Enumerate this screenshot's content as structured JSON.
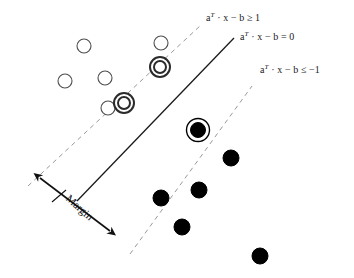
{
  "figure": {
    "background_color": "#ffffff",
    "width": 354,
    "height": 278
  },
  "labels": {
    "upper_boundary": {
      "text": "aT · x − b ≥ 1",
      "a": "a",
      "sup": "T",
      "rest": " · x − b ≥ 1",
      "x": 206,
      "y": 11,
      "color": "#1a1a1a"
    },
    "hyperplane": {
      "text": "aT · x − b = 0",
      "a": "a",
      "sup": "T",
      "rest": " · x − b = 0",
      "x": 240,
      "y": 30,
      "color": "#1a1a1a"
    },
    "lower_boundary": {
      "text": "aT · x − b ≤ −1",
      "a": "a",
      "sup": "T",
      "rest": " · x − b ≤ −1",
      "x": 260,
      "y": 63,
      "color": "#1a1a1a"
    },
    "margin": {
      "text": "Margin",
      "x": 72,
      "y": 192,
      "rotation_deg": 42,
      "color": "#111111"
    }
  },
  "chart_data": {
    "type": "scatter",
    "xlabel": "",
    "ylabel": "",
    "grid": false,
    "legend": "none",
    "xlim": [
      0,
      354
    ],
    "ylim": [
      0,
      278
    ],
    "note": "Coordinates are in image pixel space; y increases downward.",
    "lines": [
      {
        "name": "upper-margin-boundary",
        "equation": "aT · x − b = 1",
        "style": "dashed",
        "color": "#999999",
        "width": 1,
        "x1": 28,
        "y1": 186,
        "x2": 201,
        "y2": 25
      },
      {
        "name": "separating-hyperplane",
        "equation": "aT · x − b = 0",
        "style": "solid",
        "color": "#1a1a1a",
        "width": 1.3,
        "x1": 77,
        "y1": 201,
        "x2": 234,
        "y2": 38
      },
      {
        "name": "lower-margin-boundary",
        "equation": "aT · x − b = −1",
        "style": "dashed",
        "color": "#999999",
        "width": 1,
        "x1": 130,
        "y1": 254,
        "x2": 252,
        "y2": 86
      }
    ],
    "margin_arrow": {
      "name": "margin-double-arrow",
      "color": "#111111",
      "width": 1.6,
      "x1": 40,
      "y1": 178,
      "x2": 110,
      "y2": 231,
      "tick": {
        "x1": 52,
        "y1": 202,
        "x2": 66,
        "y2": 190
      },
      "double_headed": true
    },
    "series": [
      {
        "name": "class-positive",
        "marker": "hollow-circle",
        "marker_color": "#ffffff",
        "edge_color": "#4d4d4d",
        "radius": 7,
        "points": [
          {
            "x": 84,
            "y": 46,
            "support_vector": false
          },
          {
            "x": 161,
            "y": 43,
            "support_vector": false
          },
          {
            "x": 65,
            "y": 81,
            "support_vector": false
          },
          {
            "x": 105,
            "y": 78,
            "support_vector": false
          },
          {
            "x": 108,
            "y": 108,
            "support_vector": false
          },
          {
            "x": 160,
            "y": 67,
            "support_vector": true
          },
          {
            "x": 124,
            "y": 103,
            "support_vector": true
          }
        ]
      },
      {
        "name": "class-negative",
        "marker": "filled-circle",
        "marker_color": "#000000",
        "edge_color": "#000000",
        "radius": 8,
        "points": [
          {
            "x": 198,
            "y": 130,
            "support_vector": true
          },
          {
            "x": 231,
            "y": 158,
            "support_vector": false
          },
          {
            "x": 199,
            "y": 190,
            "support_vector": false
          },
          {
            "x": 161,
            "y": 198,
            "support_vector": false
          },
          {
            "x": 182,
            "y": 227,
            "support_vector": false
          },
          {
            "x": 260,
            "y": 256,
            "support_vector": false
          }
        ]
      }
    ]
  }
}
